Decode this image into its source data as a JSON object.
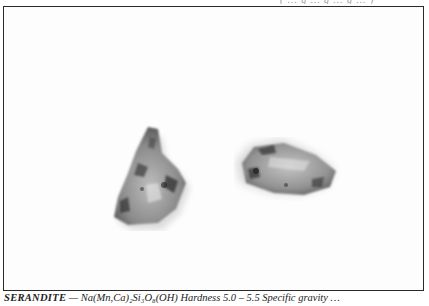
{
  "page": {
    "top_caption_fragment": "( … g … g … g … )"
  },
  "figure": {
    "specimens": [
      {
        "label": "specimen-left",
        "shape": "triangular fragment",
        "tone": "grey with dark inclusions"
      },
      {
        "label": "specimen-right",
        "shape": "elongated fragment",
        "tone": "grey with dark inclusions"
      }
    ]
  },
  "caption": {
    "mineral_name": "SERANDITE",
    "formula_and_text": " — Na(Mn,Ca)₂Si₃O₈(OH)  Hardness 5.0 – 5.5  Specific gravity …"
  }
}
